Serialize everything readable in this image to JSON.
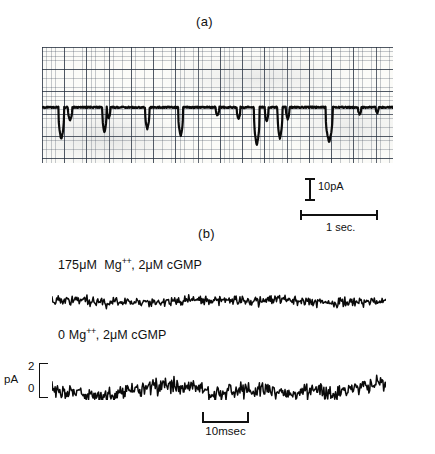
{
  "figure": {
    "panel_a_letter": "(a)",
    "panel_b_letter": "(b)"
  },
  "panel_a": {
    "scale_current_label": "10pA",
    "scale_time_label": "1 sec.",
    "scale_current_value": 10,
    "scale_current_unit": "pA",
    "scale_time_value": 1,
    "scale_time_unit": "sec."
  },
  "panel_b": {
    "trace_1_label_pre": "175",
    "trace_1_label_mu1": "μM",
    "trace_1_label_ion": "Mg",
    "trace_1_label_charge": "++",
    "trace_1_label_post": ", 2",
    "trace_1_label_mu2": "μM",
    "trace_1_label_ligand": "cGMP",
    "trace_1_label_full": "175 μM Mg++, 2 μM cGMP",
    "trace_2_label_pre": "0",
    "trace_2_label_ion": "Mg",
    "trace_2_label_charge": "++",
    "trace_2_label_post": ", 2",
    "trace_2_label_mu2": "μM",
    "trace_2_label_ligand": "cGMP",
    "trace_2_label_full": "0 Mg++, 2 μM cGMP",
    "yaxis_unit": "pA",
    "yaxis_tick_high": "2",
    "yaxis_tick_low": "0",
    "scale_time_label": "10msec",
    "scale_time_value": 10,
    "scale_time_unit": "msec"
  },
  "chart_data": {
    "type": "line",
    "title": "",
    "subtitle": "",
    "panels": [
      {
        "id": "a",
        "label": "(a)",
        "description": "Single-channel current recording on chart-recorder grid paper; baseline with downward unitary current openings.",
        "xlabel": "time",
        "ylabel": "current",
        "x_unit": "sec",
        "y_unit": "pA",
        "x_scalebar": {
          "length": 1,
          "unit": "sec.",
          "label": "1 sec."
        },
        "y_scalebar": {
          "length": 10,
          "unit": "pA",
          "label": "10pA"
        },
        "grid": true,
        "grid_minor_spacing_px": 4.45,
        "grid_major_spacing_px": 22.25,
        "baseline_y_frac": 0.52,
        "events": [
          {
            "x_frac": 0.055,
            "depth_frac": 0.28,
            "width_frac": 0.008
          },
          {
            "x_frac": 0.08,
            "depth_frac": 0.11,
            "width_frac": 0.006
          },
          {
            "x_frac": 0.178,
            "depth_frac": 0.22,
            "width_frac": 0.006
          },
          {
            "x_frac": 0.19,
            "depth_frac": 0.09,
            "width_frac": 0.005
          },
          {
            "x_frac": 0.3,
            "depth_frac": 0.19,
            "width_frac": 0.006
          },
          {
            "x_frac": 0.395,
            "depth_frac": 0.25,
            "width_frac": 0.007
          },
          {
            "x_frac": 0.5,
            "depth_frac": 0.07,
            "width_frac": 0.005
          },
          {
            "x_frac": 0.56,
            "depth_frac": 0.1,
            "width_frac": 0.005
          },
          {
            "x_frac": 0.612,
            "depth_frac": 0.33,
            "width_frac": 0.008
          },
          {
            "x_frac": 0.64,
            "depth_frac": 0.12,
            "width_frac": 0.005
          },
          {
            "x_frac": 0.678,
            "depth_frac": 0.27,
            "width_frac": 0.007
          },
          {
            "x_frac": 0.7,
            "depth_frac": 0.1,
            "width_frac": 0.005
          },
          {
            "x_frac": 0.818,
            "depth_frac": 0.3,
            "width_frac": 0.01
          },
          {
            "x_frac": 0.905,
            "depth_frac": 0.06,
            "width_frac": 0.005
          },
          {
            "x_frac": 0.955,
            "depth_frac": 0.05,
            "width_frac": 0.004
          }
        ]
      },
      {
        "id": "b-1",
        "label": "175 μM Mg++, 2 μM cGMP",
        "description": "Current noise trace in presence of 175 micromolar magnesium and 2 micromolar cGMP; low-amplitude fluctuations.",
        "xlabel": "time",
        "ylabel": "pA",
        "x_unit": "msec",
        "y_unit": "pA",
        "noise_amplitude_pA": 0.55,
        "mean_pA": 0.9,
        "n_points": 430,
        "seed": 20771
      },
      {
        "id": "b-2",
        "label": "0 Mg++, 2 μM cGMP",
        "description": "Current noise trace in zero magnesium with 2 micromolar cGMP; markedly larger fluctuations.",
        "xlabel": "time",
        "ylabel": "pA",
        "x_unit": "msec",
        "y_unit": "pA",
        "noise_amplitude_pA": 1.45,
        "mean_pA": 1.0,
        "yticks": [
          0,
          2
        ],
        "ylim": [
          -0.4,
          3.0
        ],
        "n_points": 430,
        "seed": 41039,
        "x_scalebar": {
          "length": 10,
          "unit": "msec",
          "label": "10msec"
        }
      }
    ]
  }
}
